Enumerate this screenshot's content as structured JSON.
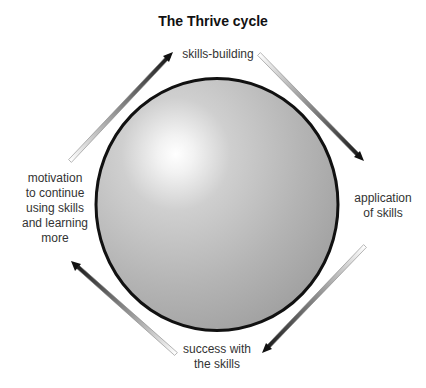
{
  "title": "The Thrive cycle",
  "center": {
    "shape": "sphere",
    "fill_highlight": "#ffffff",
    "fill_base": "#a9a9a9",
    "outline": "#111111"
  },
  "stages": [
    {
      "id": "top",
      "label": "skills-building"
    },
    {
      "id": "right",
      "label": "application of skills",
      "lines": [
        "application",
        "of skills"
      ]
    },
    {
      "id": "bottom",
      "label": "success with the skills",
      "lines": [
        "success with",
        "the skills"
      ]
    },
    {
      "id": "left",
      "label": "motivation to continue using skills and learning more",
      "lines": [
        "motivation",
        "to continue",
        "using skills",
        "and learning",
        "more"
      ]
    }
  ],
  "arrows": [
    {
      "from": "left",
      "to": "top",
      "direction": "clockwise"
    },
    {
      "from": "top",
      "to": "right",
      "direction": "clockwise"
    },
    {
      "from": "right",
      "to": "bottom",
      "direction": "clockwise"
    },
    {
      "from": "bottom",
      "to": "left",
      "direction": "clockwise"
    }
  ],
  "colors": {
    "text": "#333333",
    "title": "#111111",
    "arrow_dark": "#1a1a1a",
    "arrow_light": "#ffffff"
  }
}
